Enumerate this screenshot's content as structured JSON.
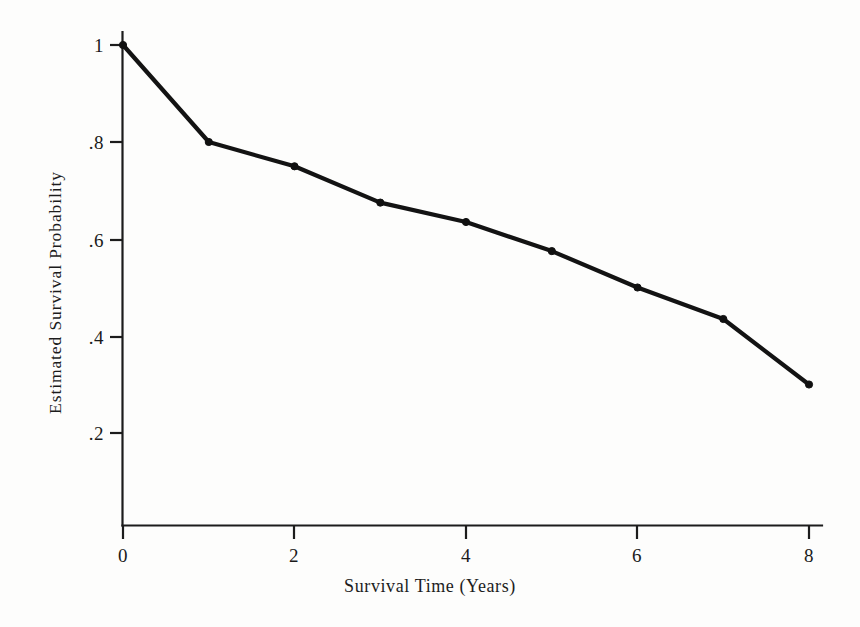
{
  "chart_data": {
    "type": "line",
    "title": "",
    "xlabel": "Survival Time (Years)",
    "ylabel": "Estimated Survival Probability",
    "x": [
      0,
      1,
      2,
      3,
      4,
      5,
      6,
      7,
      8
    ],
    "values": [
      1.0,
      0.8,
      0.75,
      0.675,
      0.635,
      0.575,
      0.5,
      0.435,
      0.3
    ],
    "series": [
      {
        "name": "Estimated survival probability",
        "values": [
          1.0,
          0.8,
          0.75,
          0.675,
          0.635,
          0.575,
          0.5,
          0.435,
          0.3
        ]
      }
    ],
    "xlim": [
      0,
      8
    ],
    "ylim": [
      0,
      1
    ],
    "xticks": [
      0,
      2,
      4,
      6,
      8
    ],
    "xticklabels": [
      "0",
      "2",
      "4",
      "6",
      "8"
    ],
    "yticks": [
      0.2,
      0.4,
      0.6,
      0.8,
      1.0
    ],
    "yticklabels": [
      ".2",
      ".4",
      ".6",
      ".8",
      "1"
    ],
    "grid": false,
    "legend": "none",
    "markers": true,
    "line_color": "#131313",
    "marker_color": "#101010",
    "axis_color": "#1c1c1c",
    "background_color": "#fdfdfc"
  },
  "axes": {
    "x_title": "Survival Time (Years)",
    "y_title": "Estimated Survival Probability"
  },
  "ticks": {
    "y": [
      {
        "label": "1",
        "value": 1.0
      },
      {
        "label": ".8",
        "value": 0.8
      },
      {
        "label": ".6",
        "value": 0.6
      },
      {
        "label": ".4",
        "value": 0.4
      },
      {
        "label": ".2",
        "value": 0.2
      }
    ],
    "x": [
      {
        "label": "0",
        "value": 0
      },
      {
        "label": "2",
        "value": 2
      },
      {
        "label": "4",
        "value": 4
      },
      {
        "label": "6",
        "value": 6
      },
      {
        "label": "8",
        "value": 8
      }
    ]
  }
}
